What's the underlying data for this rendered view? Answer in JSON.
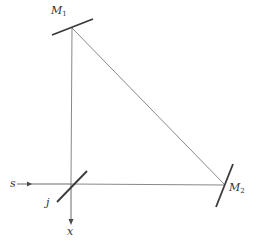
{
  "diagram": {
    "type": "optical-ray-diagram",
    "labels": {
      "m1_main": "M",
      "m1_sub": "1",
      "m2_main": "M",
      "m2_sub": "2",
      "source": "s",
      "splitter": "j",
      "output": "x"
    },
    "colors": {
      "beam": "#6a6a6a",
      "mirror": "#3a3a3a",
      "text": "#333333"
    },
    "nodes": [
      {
        "id": "M1",
        "role": "mirror",
        "x": 72,
        "y": 28
      },
      {
        "id": "M2",
        "role": "mirror",
        "x": 225,
        "y": 185
      },
      {
        "id": "j",
        "role": "beam-splitter",
        "x": 71,
        "y": 184
      },
      {
        "id": "s",
        "role": "source",
        "x": 12,
        "y": 184
      },
      {
        "id": "x",
        "role": "output",
        "x": 71,
        "y": 226
      }
    ],
    "edges": [
      {
        "from": "s",
        "to": "j"
      },
      {
        "from": "j",
        "to": "M1"
      },
      {
        "from": "M1",
        "to": "M2"
      },
      {
        "from": "M2",
        "to": "j"
      },
      {
        "from": "j",
        "to": "x"
      }
    ]
  }
}
